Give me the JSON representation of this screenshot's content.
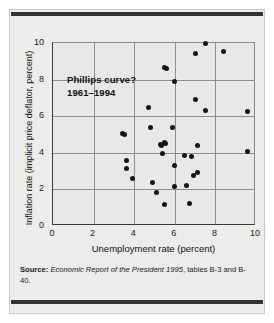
{
  "figure": {
    "annotation_line1": "Phillips curve?",
    "annotation_line2": "1961–1994",
    "source_label": "Source:",
    "source_italic": "Economic Report of the President 1995",
    "source_rest": ", tables B-3 and B-40."
  },
  "chart_data": {
    "type": "scatter",
    "title": "Phillips curve? 1961–1994",
    "xlabel": "Unemployment rate (percent)",
    "ylabel": "Inflation rate (implicit price deflator, percent)",
    "xlim": [
      0,
      10
    ],
    "ylim": [
      0,
      10
    ],
    "xticks": [
      0,
      2,
      4,
      6,
      8,
      10
    ],
    "yticks": [
      0,
      2,
      4,
      6,
      8,
      10
    ],
    "grid": true,
    "legend": null,
    "series_name": "Unemployment vs. inflation, 1961–1994",
    "marker_color": "#161616",
    "points": [
      {
        "x": 3.4,
        "y": 5.05
      },
      {
        "x": 3.5,
        "y": 5.0
      },
      {
        "x": 3.6,
        "y": 3.6
      },
      {
        "x": 3.6,
        "y": 3.15
      },
      {
        "x": 3.9,
        "y": 2.6
      },
      {
        "x": 4.7,
        "y": 6.45
      },
      {
        "x": 4.8,
        "y": 5.4
      },
      {
        "x": 4.9,
        "y": 2.35
      },
      {
        "x": 5.1,
        "y": 1.85
      },
      {
        "x": 5.3,
        "y": 4.45
      },
      {
        "x": 5.35,
        "y": 4.4
      },
      {
        "x": 5.4,
        "y": 3.95
      },
      {
        "x": 5.5,
        "y": 4.55
      },
      {
        "x": 5.55,
        "y": 4.5
      },
      {
        "x": 5.5,
        "y": 8.65
      },
      {
        "x": 5.6,
        "y": 8.6
      },
      {
        "x": 5.5,
        "y": 1.2
      },
      {
        "x": 5.9,
        "y": 5.4
      },
      {
        "x": 6.0,
        "y": 7.9
      },
      {
        "x": 6.0,
        "y": 3.3
      },
      {
        "x": 6.0,
        "y": 2.15
      },
      {
        "x": 6.5,
        "y": 3.85
      },
      {
        "x": 6.6,
        "y": 2.2
      },
      {
        "x": 6.7,
        "y": 1.25
      },
      {
        "x": 6.8,
        "y": 3.8
      },
      {
        "x": 6.9,
        "y": 2.75
      },
      {
        "x": 7.0,
        "y": 6.9
      },
      {
        "x": 7.1,
        "y": 2.9
      },
      {
        "x": 7.1,
        "y": 4.4
      },
      {
        "x": 7.0,
        "y": 9.45
      },
      {
        "x": 7.5,
        "y": 10.0
      },
      {
        "x": 7.5,
        "y": 6.3
      },
      {
        "x": 8.4,
        "y": 9.55
      },
      {
        "x": 9.6,
        "y": 6.25
      },
      {
        "x": 9.6,
        "y": 4.05
      }
    ]
  },
  "axes": {
    "x_ticks": [
      "0",
      "2",
      "4",
      "6",
      "8",
      "10"
    ],
    "y_ticks": [
      "0",
      "2",
      "4",
      "6",
      "8",
      "10"
    ],
    "x_title": "Unemployment rate (percent)",
    "y_title": "Inflation rate (implicit price deflator, percent)"
  }
}
